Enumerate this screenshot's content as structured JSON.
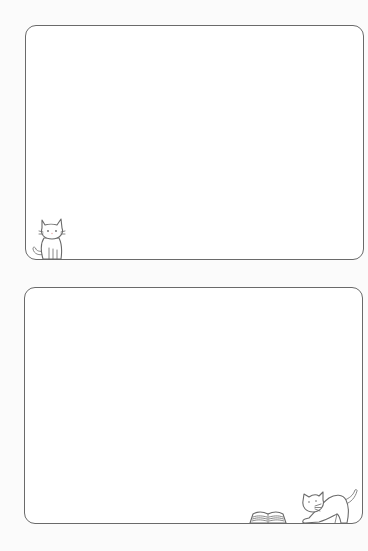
{
  "page": {
    "background": "#fbfbfb",
    "stroke_color": "#6a6a6a",
    "frames": [
      {
        "id": "frame1",
        "content": "",
        "decoration": "sitting-cat-icon"
      },
      {
        "id": "frame2",
        "content": "",
        "decoration": [
          "open-book-icon",
          "stretching-cat-icon"
        ]
      }
    ]
  }
}
